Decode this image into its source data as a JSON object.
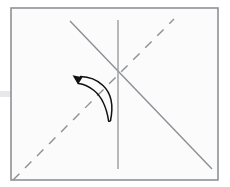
{
  "figure": {
    "type": "origami-crease-diagram",
    "canvas": {
      "width": 230,
      "height": 187,
      "background": "#ffffff"
    }
  },
  "paper": {
    "label": "paper-sheet",
    "shape": "rectangle",
    "x": 11,
    "y": 8,
    "width": 207,
    "height": 172,
    "fill": "#fbfbfb",
    "stroke": "#8e9196",
    "stroke_width": 1.6
  },
  "edge_tab": {
    "label": "left-edge-tab",
    "x": 0,
    "y": 91,
    "width": 12,
    "height": 6,
    "fill": "#e7e8e9"
  },
  "creases": [
    {
      "name": "vertical-crease",
      "style": "solid",
      "color": "#9a9ca0",
      "width": 1.4,
      "x1": 118,
      "y1": 20,
      "x2": 118,
      "y2": 169
    },
    {
      "name": "diagonal-crease-solid",
      "style": "solid",
      "color": "#8c8f94",
      "width": 1.4,
      "x1": 70,
      "y1": 21,
      "x2": 212,
      "y2": 169
    },
    {
      "name": "diagonal-crease-dashed",
      "style": "dashed",
      "color": "#8c8f94",
      "width": 1.4,
      "dash": "9 8",
      "x1": 13,
      "y1": 180,
      "x2": 174,
      "y2": 19
    }
  ],
  "arrow": {
    "name": "fold-arrow",
    "color": "#111111",
    "direction": "up-left",
    "description": "curved tapered fold arrow with solid triangular head",
    "head": {
      "x": 78,
      "y": 78,
      "size": 9
    },
    "tail": {
      "x": 110,
      "y": 120
    }
  },
  "colors": {
    "paper_fill": "#fbfbfb",
    "paper_stroke": "#8e9196",
    "crease_gray": "#8c8f94",
    "arrow_black": "#111111",
    "tab_gray": "#e7e8e9"
  }
}
